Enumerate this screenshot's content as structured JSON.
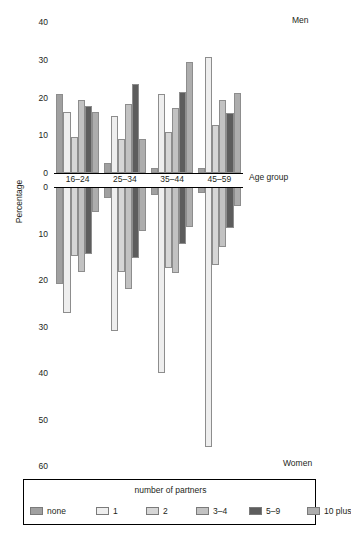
{
  "panels": {
    "men_label": "Men",
    "women_label": "Women"
  },
  "axes": {
    "y_title": "Percentage",
    "x_title": "Age group",
    "top_ticks": [
      "40",
      "30",
      "20",
      "10",
      "0"
    ],
    "bottom_ticks": [
      "0",
      "10",
      "20",
      "30",
      "40",
      "50",
      "60"
    ],
    "categories": [
      "16–24",
      "25–34",
      "35–44",
      "45–59"
    ]
  },
  "legend": {
    "title": "number of partners",
    "items": [
      {
        "label": "none",
        "color": "#a0a0a0"
      },
      {
        "label": "1",
        "color": "#eeeeee"
      },
      {
        "label": "2",
        "color": "#d6d6d6"
      },
      {
        "label": "3–4",
        "color": "#c2c2c2"
      },
      {
        "label": "5–9",
        "color": "#5d5d5d"
      },
      {
        "label": "10 plus",
        "color": "#adadad"
      }
    ]
  },
  "chart_data": {
    "type": "bar",
    "title": "",
    "subtitle": "",
    "xlabel": "Age group",
    "ylabel": "Percentage",
    "orientation": "vertical",
    "layout": "back-to-back population pyramid (Men above axis, Women below axis)",
    "grid": false,
    "legend_position": "bottom",
    "legend_title": "number of partners",
    "categories": [
      "16–24",
      "25–34",
      "35–44",
      "45–59"
    ],
    "series_names": [
      "none",
      "1",
      "2",
      "3–4",
      "5–9",
      "10 plus"
    ],
    "panels": [
      {
        "name": "Men",
        "ylim": [
          0,
          40
        ],
        "yticks": [
          0,
          10,
          20,
          30,
          40
        ],
        "direction": "up",
        "series": [
          {
            "name": "none",
            "values": [
              21.0,
              2.7,
              1.3,
              1.3
            ]
          },
          {
            "name": "1",
            "values": [
              16.2,
              15.0,
              21.0,
              30.8
            ]
          },
          {
            "name": "2",
            "values": [
              9.5,
              9.0,
              10.8,
              12.7
            ]
          },
          {
            "name": "3–4",
            "values": [
              19.3,
              18.2,
              17.2,
              19.4
            ]
          },
          {
            "name": "5–9",
            "values": [
              17.8,
              23.5,
              21.4,
              15.8
            ]
          },
          {
            "name": "10 plus",
            "values": [
              16.1,
              9.1,
              29.3,
              21.3
            ]
          }
        ]
      },
      {
        "name": "Women",
        "ylim": [
          0,
          60
        ],
        "yticks": [
          0,
          10,
          20,
          30,
          40,
          50,
          60
        ],
        "direction": "down",
        "series": [
          {
            "name": "none",
            "values": [
              20.8,
              2.4,
              1.7,
              1.3
            ]
          },
          {
            "name": "1",
            "values": [
              27.0,
              31.0,
              40.0,
              56.0
            ]
          },
          {
            "name": "2",
            "values": [
              14.8,
              18.3,
              17.5,
              16.8
            ]
          },
          {
            "name": "3–4",
            "values": [
              18.2,
              22.0,
              18.6,
              13.0
            ]
          },
          {
            "name": "5–9",
            "values": [
              14.4,
              15.2,
              12.3,
              8.8
            ]
          },
          {
            "name": "10 plus",
            "values": [
              5.3,
              9.4,
              8.7,
              4.0
            ]
          }
        ]
      }
    ]
  }
}
